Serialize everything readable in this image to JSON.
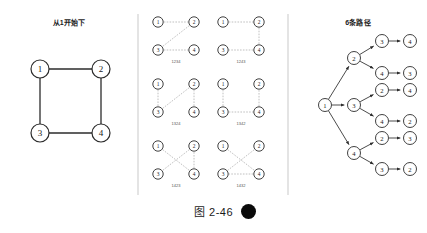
{
  "figure": {
    "caption": "图 2-46",
    "caption_left_icon": "crescent-moon-shape",
    "caption_right_icon": "filled-circle-shape"
  },
  "panels": {
    "left": {
      "title": "从1开始下",
      "graph": {
        "type": "undirected-graph",
        "nodes": [
          {
            "id": "1",
            "label": "1",
            "cx": 40,
            "cy": 69
          },
          {
            "id": "2",
            "label": "2",
            "cx": 101,
            "cy": 69
          },
          {
            "id": "3",
            "label": "3",
            "cx": 40,
            "cy": 133
          },
          {
            "id": "4",
            "label": "4",
            "cx": 101,
            "cy": 133
          }
        ],
        "edges": [
          [
            "1",
            "2"
          ],
          [
            "1",
            "3"
          ],
          [
            "2",
            "4"
          ],
          [
            "3",
            "4"
          ]
        ],
        "node_radius": 9
      }
    },
    "middle": {
      "node_radius": 5.2,
      "patterns": [
        {
          "label": "1234",
          "ox": 150,
          "oy": 22,
          "nodes": [
            {
              "label": "1",
              "dx": 8,
              "dy": 0
            },
            {
              "label": "2",
              "dx": 44,
              "dy": 0
            },
            {
              "label": "3",
              "dx": 8,
              "dy": 28
            },
            {
              "label": "4",
              "dx": 44,
              "dy": 28
            }
          ],
          "path": [
            "1",
            "2",
            "3",
            "4"
          ]
        },
        {
          "label": "1243",
          "ox": 215,
          "oy": 22,
          "nodes": [
            {
              "label": "1",
              "dx": 8,
              "dy": 0
            },
            {
              "label": "2",
              "dx": 44,
              "dy": 0
            },
            {
              "label": "3",
              "dx": 8,
              "dy": 28
            },
            {
              "label": "4",
              "dx": 44,
              "dy": 28
            }
          ],
          "path": [
            "1",
            "2",
            "4",
            "3"
          ]
        },
        {
          "label": "1324",
          "ox": 150,
          "oy": 84,
          "nodes": [
            {
              "label": "1",
              "dx": 8,
              "dy": 0
            },
            {
              "label": "2",
              "dx": 44,
              "dy": 0
            },
            {
              "label": "3",
              "dx": 8,
              "dy": 28
            },
            {
              "label": "4",
              "dx": 44,
              "dy": 28
            }
          ],
          "path": [
            "1",
            "3",
            "2",
            "4"
          ]
        },
        {
          "label": "1342",
          "ox": 215,
          "oy": 84,
          "nodes": [
            {
              "label": "1",
              "dx": 8,
              "dy": 0
            },
            {
              "label": "2",
              "dx": 44,
              "dy": 0
            },
            {
              "label": "3",
              "dx": 8,
              "dy": 28
            },
            {
              "label": "4",
              "dx": 44,
              "dy": 28
            }
          ],
          "path": [
            "1",
            "3",
            "4",
            "2"
          ]
        },
        {
          "label": "1423",
          "ox": 150,
          "oy": 146,
          "nodes": [
            {
              "label": "1",
              "dx": 8,
              "dy": 0
            },
            {
              "label": "2",
              "dx": 44,
              "dy": 0
            },
            {
              "label": "3",
              "dx": 8,
              "dy": 28
            },
            {
              "label": "4",
              "dx": 44,
              "dy": 28
            }
          ],
          "path": [
            "1",
            "4",
            "2",
            "3"
          ]
        },
        {
          "label": "1432",
          "ox": 215,
          "oy": 146,
          "nodes": [
            {
              "label": "1",
              "dx": 8,
              "dy": 0
            },
            {
              "label": "2",
              "dx": 44,
              "dy": 0
            },
            {
              "label": "3",
              "dx": 8,
              "dy": 28
            },
            {
              "label": "4",
              "dx": 44,
              "dy": 28
            }
          ],
          "path": [
            "1",
            "4",
            "3",
            "2"
          ]
        }
      ]
    },
    "right": {
      "title": "6条路径",
      "node_radius": 6.5,
      "tree": {
        "root": {
          "label": "1",
          "cx": 325,
          "cy": 105
        },
        "branches": [
          {
            "level1": {
              "label": "2",
              "cx": 354,
              "cy": 58
            },
            "children": [
              {
                "l2": {
                  "label": "3",
                  "cx": 382,
                  "cy": 41
                },
                "l3": {
                  "label": "4",
                  "cx": 410,
                  "cy": 41
                }
              },
              {
                "l2": {
                  "label": "4",
                  "cx": 382,
                  "cy": 73
                },
                "l3": {
                  "label": "3",
                  "cx": 410,
                  "cy": 73
                }
              }
            ]
          },
          {
            "level1": {
              "label": "3",
              "cx": 354,
              "cy": 105
            },
            "children": [
              {
                "l2": {
                  "label": "2",
                  "cx": 382,
                  "cy": 90
                },
                "l3": {
                  "label": "4",
                  "cx": 410,
                  "cy": 90
                }
              },
              {
                "l2": {
                  "label": "4",
                  "cx": 382,
                  "cy": 121
                },
                "l3": {
                  "label": "2",
                  "cx": 410,
                  "cy": 121
                }
              }
            ]
          },
          {
            "level1": {
              "label": "4",
              "cx": 354,
              "cy": 153
            },
            "children": [
              {
                "l2": {
                  "label": "2",
                  "cx": 382,
                  "cy": 138
                },
                "l3": {
                  "label": "3",
                  "cx": 410,
                  "cy": 138
                }
              },
              {
                "l2": {
                  "label": "3",
                  "cx": 382,
                  "cy": 169
                },
                "l3": {
                  "label": "2",
                  "cx": 410,
                  "cy": 169
                }
              }
            ]
          }
        ]
      }
    }
  },
  "dividers": [
    {
      "x": 138,
      "y1": 14,
      "y2": 195
    },
    {
      "x": 288,
      "y1": 14,
      "y2": 195
    }
  ],
  "colors": {
    "ink": "#1a1a1a",
    "node_stroke": "#2b2b2b",
    "edge": "#2b2b2b",
    "faint_edge": "#b9b9b9",
    "divider": "#c9c9c9",
    "background": "#ffffff",
    "caption_dot": "#0a0a0a"
  }
}
